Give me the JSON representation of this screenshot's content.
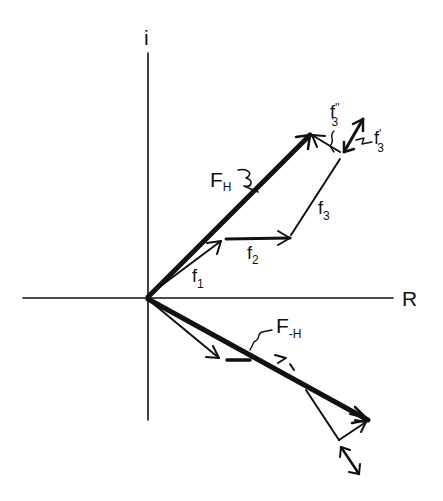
{
  "diagram": {
    "type": "vector-phasor-diagram",
    "colors": {
      "ink": "#111111",
      "background": "#ffffff"
    },
    "axes": {
      "vertical_label": "i",
      "horizontal_label": "R"
    },
    "labels": {
      "F_H": {
        "main": "F",
        "sub": "H"
      },
      "F_minus_H": {
        "main": "F",
        "sub": "-H"
      },
      "f1": {
        "main": "f",
        "sub": "1"
      },
      "f2": {
        "main": "f",
        "sub": "2"
      },
      "f3": {
        "main": "f",
        "sub": "3"
      },
      "f3_double_prime": {
        "main": "f",
        "sub": "3",
        "prime": "''"
      },
      "f3_prime": {
        "main": "f",
        "sub": "3",
        "prime": "'"
      }
    }
  }
}
